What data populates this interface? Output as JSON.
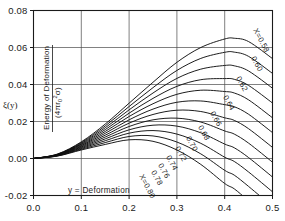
{
  "figure": {
    "symbol_label": "ξ(y)",
    "y_axis_numerator": "Energy of Deformation",
    "y_axis_denominator_prefix": "(4",
    "y_axis_denominator_pi": "π",
    "y_axis_denominator_r": "r",
    "y_axis_denominator_sub": "0",
    "y_axis_denominator_sup": "2",
    "y_axis_denominator_sigma": "σ",
    "y_axis_denominator_suffix": ")",
    "x_axis_title": "y = Deformation"
  },
  "chart_data": {
    "type": "line",
    "title": "",
    "subtitle": "",
    "xlabel": "y = Deformation",
    "ylabel": "Energy of Deformation / (4πr₀²σ)",
    "ylabel_symbol": "ξ(y)",
    "xlim": [
      0.0,
      0.5
    ],
    "ylim": [
      -0.02,
      0.08
    ],
    "xticks": [
      0.0,
      0.1,
      0.2,
      0.3,
      0.4,
      0.5
    ],
    "xtick_labels": [
      "0.0",
      "0.1",
      "0.2",
      "0.3",
      "0.4",
      "0.5"
    ],
    "yticks": [
      -0.02,
      0.0,
      0.02,
      0.04,
      0.06,
      0.08
    ],
    "ytick_labels": [
      "-0.02",
      "0.00",
      "0.02",
      "0.04",
      "0.06",
      "0.08"
    ],
    "grid": true,
    "legend": "inline-curve-labels",
    "legend_position": "right-of-curves",
    "series_label_prefix": "X=",
    "series": [
      {
        "name": "X=0.58",
        "label": "X=0.58",
        "X": 0.58,
        "x": [
          0.0,
          0.05,
          0.1,
          0.15,
          0.2,
          0.25,
          0.3,
          0.35,
          0.4,
          0.42,
          0.45,
          0.5
        ],
        "values": [
          0.0,
          0.0024,
          0.009,
          0.0186,
          0.0299,
          0.0412,
          0.052,
          0.06,
          0.0646,
          0.065,
          0.0632,
          0.054
        ]
      },
      {
        "name": "X=0.60",
        "label": "0.60",
        "X": 0.6,
        "x": [
          0.0,
          0.05,
          0.1,
          0.15,
          0.2,
          0.25,
          0.3,
          0.35,
          0.4,
          0.42,
          0.45,
          0.5
        ],
        "values": [
          0.0,
          0.0023,
          0.0086,
          0.0176,
          0.0281,
          0.0383,
          0.0476,
          0.0541,
          0.0574,
          0.0575,
          0.0552,
          0.046
        ]
      },
      {
        "name": "X=0.62",
        "label": "0.62",
        "X": 0.62,
        "x": [
          0.0,
          0.05,
          0.1,
          0.15,
          0.2,
          0.25,
          0.3,
          0.35,
          0.4,
          0.42,
          0.45,
          0.5
        ],
        "values": [
          0.0,
          0.0022,
          0.0082,
          0.0166,
          0.0263,
          0.0354,
          0.0433,
          0.0483,
          0.0503,
          0.0501,
          0.0473,
          0.038
        ]
      },
      {
        "name": "X=0.64",
        "label": "0.64",
        "X": 0.64,
        "x": [
          0.0,
          0.05,
          0.1,
          0.15,
          0.2,
          0.25,
          0.3,
          0.35,
          0.4,
          0.42,
          0.45,
          0.5
        ],
        "values": [
          0.0,
          0.0021,
          0.0078,
          0.0156,
          0.0245,
          0.0325,
          0.039,
          0.0426,
          0.0432,
          0.0428,
          0.0395,
          0.03
        ]
      },
      {
        "name": "X=0.66",
        "label": "0.66",
        "X": 0.66,
        "x": [
          0.0,
          0.05,
          0.1,
          0.15,
          0.2,
          0.25,
          0.3,
          0.35,
          0.4,
          0.42,
          0.45,
          0.5
        ],
        "values": [
          0.0,
          0.002,
          0.0074,
          0.0146,
          0.0227,
          0.0296,
          0.0347,
          0.0369,
          0.0362,
          0.0354,
          0.0317,
          0.022
        ]
      },
      {
        "name": "X=0.68",
        "label": "0.68",
        "X": 0.68,
        "x": [
          0.0,
          0.05,
          0.1,
          0.15,
          0.2,
          0.25,
          0.3,
          0.35,
          0.4,
          0.42,
          0.45,
          0.5
        ],
        "values": [
          0.0,
          0.0019,
          0.007,
          0.0136,
          0.0209,
          0.0267,
          0.0304,
          0.0311,
          0.0291,
          0.028,
          0.0239,
          0.014
        ]
      },
      {
        "name": "X=0.70",
        "label": "0.70",
        "X": 0.7,
        "x": [
          0.0,
          0.05,
          0.1,
          0.15,
          0.2,
          0.25,
          0.3,
          0.35,
          0.4,
          0.42,
          0.45,
          0.5
        ],
        "values": [
          0.0,
          0.0018,
          0.0066,
          0.0126,
          0.0191,
          0.0238,
          0.0261,
          0.0254,
          0.022,
          0.0206,
          0.0161,
          0.006
        ]
      },
      {
        "name": "X=0.72",
        "label": "0.72",
        "X": 0.72,
        "x": [
          0.0,
          0.05,
          0.1,
          0.15,
          0.2,
          0.25,
          0.3,
          0.35,
          0.4,
          0.42,
          0.45,
          0.5
        ],
        "values": [
          0.0,
          0.0017,
          0.0062,
          0.0116,
          0.0173,
          0.0209,
          0.0218,
          0.0197,
          0.0149,
          0.0132,
          0.0083,
          -0.002
        ]
      },
      {
        "name": "X=0.74",
        "label": "0.74",
        "X": 0.74,
        "x": [
          0.0,
          0.05,
          0.1,
          0.15,
          0.2,
          0.25,
          0.3,
          0.35,
          0.4,
          0.42,
          0.45,
          0.5
        ],
        "values": [
          0.0,
          0.0016,
          0.0058,
          0.0106,
          0.0155,
          0.018,
          0.0175,
          0.0139,
          0.0078,
          0.0058,
          0.0005,
          -0.01
        ]
      },
      {
        "name": "X=0.76",
        "label": "0.76",
        "X": 0.76,
        "x": [
          0.0,
          0.05,
          0.1,
          0.15,
          0.2,
          0.25,
          0.3,
          0.35,
          0.4,
          0.42,
          0.45,
          0.5
        ],
        "values": [
          0.0,
          0.0015,
          0.0054,
          0.0096,
          0.0137,
          0.0151,
          0.0132,
          0.0082,
          0.0007,
          -0.0016,
          -0.0073,
          -0.018
        ]
      },
      {
        "name": "X=0.78",
        "label": "0.78",
        "X": 0.78,
        "x": [
          0.0,
          0.05,
          0.1,
          0.15,
          0.2,
          0.25,
          0.3,
          0.35,
          0.4,
          0.42,
          0.45,
          0.5
        ],
        "values": [
          0.0,
          0.0014,
          0.005,
          0.0086,
          0.0119,
          0.0122,
          0.0089,
          0.0025,
          -0.0064,
          -0.009,
          -0.0151,
          -0.026
        ]
      },
      {
        "name": "X=0.80",
        "label": "X=0.80",
        "X": 0.8,
        "x": [
          0.0,
          0.05,
          0.1,
          0.15,
          0.2,
          0.25,
          0.3,
          0.35,
          0.4,
          0.42,
          0.45,
          0.5
        ],
        "values": [
          0.0,
          0.0013,
          0.0046,
          0.0076,
          0.0101,
          0.0093,
          0.0046,
          -0.0032,
          -0.0135,
          -0.0164,
          -0.0229,
          -0.034
        ]
      }
    ],
    "curve_labels": [
      {
        "text": "X=0.58",
        "x": 253,
        "y": 30,
        "rotate": 62
      },
      {
        "text": "0.60",
        "x": 251,
        "y": 58,
        "rotate": 62
      },
      {
        "text": "0.62",
        "x": 236,
        "y": 78,
        "rotate": 62
      },
      {
        "text": "0.64",
        "x": 223,
        "y": 97,
        "rotate": 62
      },
      {
        "text": "0.66",
        "x": 210,
        "y": 113,
        "rotate": 62
      },
      {
        "text": "0.68",
        "x": 198,
        "y": 127,
        "rotate": 62
      },
      {
        "text": "0.70",
        "x": 186,
        "y": 138,
        "rotate": 62
      },
      {
        "text": "0.72",
        "x": 175,
        "y": 148,
        "rotate": 62
      },
      {
        "text": "0.74",
        "x": 166,
        "y": 157,
        "rotate": 62
      },
      {
        "text": "0.76",
        "x": 158,
        "y": 165,
        "rotate": 62
      },
      {
        "text": "0.78",
        "x": 151,
        "y": 172,
        "rotate": 62
      },
      {
        "text": "X=0.80",
        "x": 139,
        "y": 176,
        "rotate": 62
      }
    ]
  }
}
